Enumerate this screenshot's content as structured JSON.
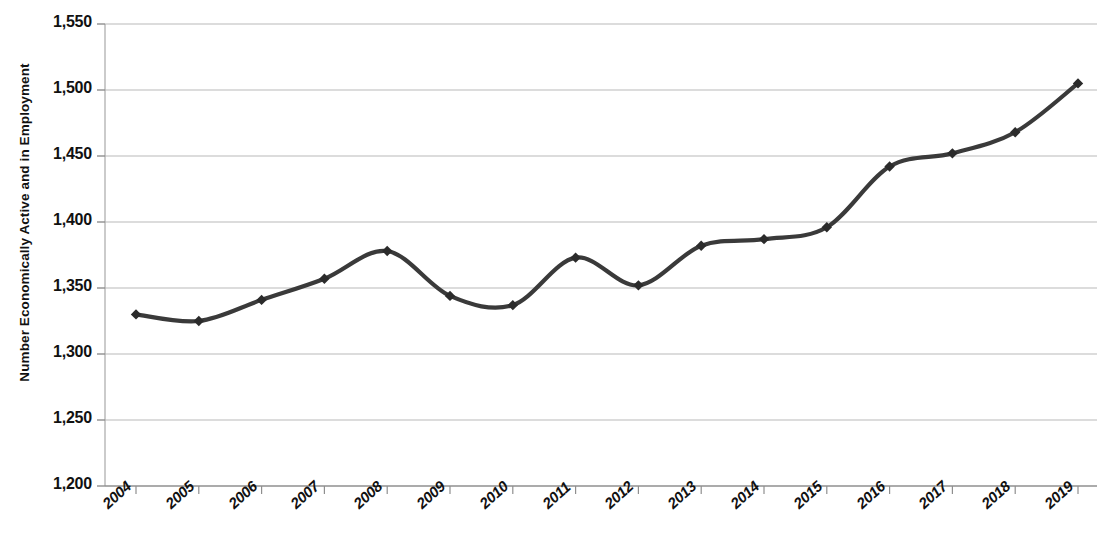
{
  "chart_data": {
    "type": "line",
    "title": "",
    "xlabel": "",
    "ylabel": "Number Economically Active and in Employment",
    "categories": [
      "2004",
      "2005",
      "2006",
      "2007",
      "2008",
      "2009",
      "2010",
      "2011",
      "2012",
      "2013",
      "2014",
      "2015",
      "2016",
      "2017",
      "2018",
      "2019"
    ],
    "values": [
      1330,
      1325,
      1341,
      1357,
      1378,
      1344,
      1337,
      1373,
      1352,
      1382,
      1387,
      1396,
      1442,
      1452,
      1468,
      1505
    ],
    "series": [
      {
        "name": "Number Economically Active and in Employment",
        "values": [
          1330,
          1325,
          1341,
          1357,
          1378,
          1344,
          1337,
          1373,
          1352,
          1382,
          1387,
          1396,
          1442,
          1452,
          1468,
          1505
        ]
      }
    ],
    "ylim": [
      1200,
      1550
    ],
    "ytick_labels": [
      "1,200",
      "1,250",
      "1,300",
      "1,350",
      "1,400",
      "1,450",
      "1,500",
      "1,550"
    ],
    "ytick_values": [
      1200,
      1250,
      1300,
      1350,
      1400,
      1450,
      1500,
      1550
    ],
    "grid": true,
    "grid_axis": "y",
    "legend": "none",
    "line_color": "#3a3a3a",
    "marker": "diamond",
    "marker_color": "#2b2b2b",
    "smoothing": "spline",
    "background_color": "#ffffff",
    "axis_color": "#a8a8a8",
    "grid_color": "#b9b9b9"
  },
  "axis": {
    "y_title": "Number Economically Active and in Employment"
  }
}
